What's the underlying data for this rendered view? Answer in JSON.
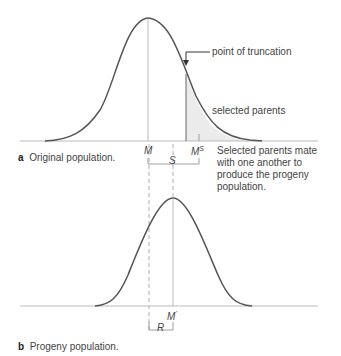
{
  "panel_a": {
    "letter": "a",
    "caption": "Original population.",
    "mean_label": "M",
    "selected_mean_label": "M",
    "selected_mean_sup": "S",
    "differential_label": "S",
    "truncation_label": "point of truncation",
    "selected_label": "selected parents",
    "note_lines": [
      "Selected parents mate",
      "with one another to",
      "produce the progeny",
      "population."
    ]
  },
  "panel_b": {
    "letter": "b",
    "caption": "Progeny population.",
    "mean_label": "M",
    "mean_sup": "'",
    "response_label": "R"
  },
  "colors": {
    "curve": "#555555",
    "axis": "#bbbbbb",
    "shade": "#e8e8e8",
    "guide": "#aaaaaa"
  }
}
